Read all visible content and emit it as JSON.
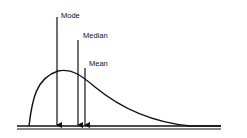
{
  "diagram": {
    "title": "",
    "type": "right-skewed distribution",
    "markers": [
      {
        "id": "mode",
        "label": "Mode",
        "position": 0.2
      },
      {
        "id": "median",
        "label": "Median",
        "position": 0.3
      },
      {
        "id": "mean",
        "label": "Mean",
        "position": 0.335
      }
    ],
    "colors": {
      "ink": "#111111",
      "background": "#ffffff"
    }
  }
}
